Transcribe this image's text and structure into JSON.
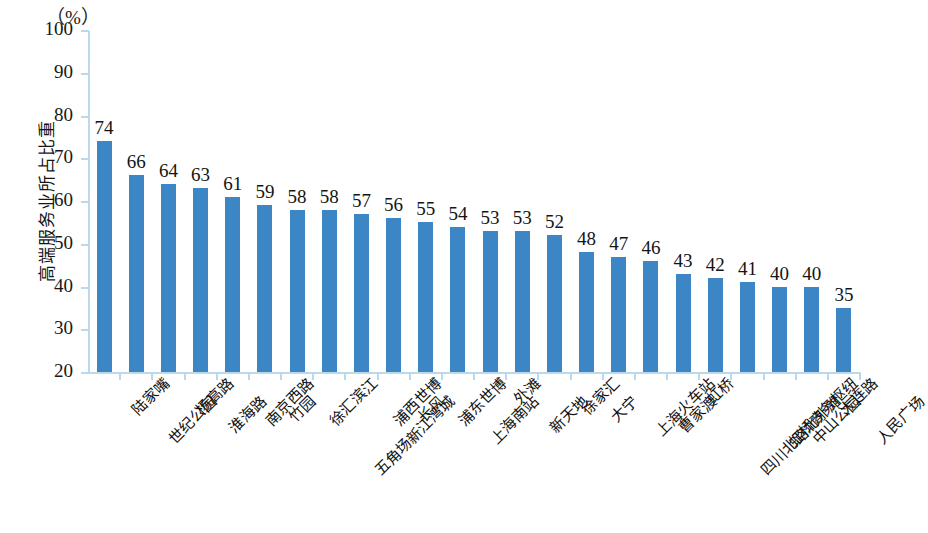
{
  "chart_data": {
    "type": "bar",
    "title": "",
    "subtitle": "",
    "xlabel": "",
    "ylabel": "高端服务业所占比重",
    "unit_label": "（%）",
    "ylim": [
      20,
      100
    ],
    "ytick_step": 10,
    "yticks": [
      100,
      90,
      80,
      70,
      60,
      50,
      40,
      30,
      20
    ],
    "grid": false,
    "legend": null,
    "bar_color": "#3d86c6",
    "axis_color": "#bcd9ec",
    "categories": [
      "陆家嘴",
      "世纪公园",
      "杨高路",
      "淮海路",
      "南京西路",
      "竹园",
      "徐汇滨江",
      "五角场新江湾城",
      "浦西世博",
      "长风",
      "浦东世博",
      "上海南站",
      "外滩",
      "新天地",
      "徐家汇",
      "大宁",
      "上海火车站",
      "曹家渡",
      "虹桥",
      "四川北路北外滩",
      "虹桥商务枢纽",
      "中山公园",
      "大连路",
      "人民广场"
    ],
    "values": [
      74,
      66,
      64,
      63,
      61,
      59,
      58,
      58,
      57,
      56,
      55,
      54,
      53,
      53,
      52,
      48,
      47,
      46,
      43,
      42,
      41,
      40,
      40,
      35
    ],
    "value_labels": [
      "74",
      "66",
      "64",
      "63",
      "61",
      "59",
      "58",
      "58",
      "57",
      "56",
      "55",
      "54",
      "53",
      "53",
      "52",
      "48",
      "47",
      "46",
      "43",
      "42",
      "41",
      "40",
      "40",
      "35"
    ]
  }
}
